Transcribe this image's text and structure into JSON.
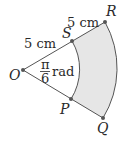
{
  "diagram": {
    "type": "annular sector",
    "colors": {
      "line": "#555555",
      "fill": "#e6e6e6",
      "point": "#555555",
      "text": "#2a2a2a"
    },
    "points": {
      "O": "O",
      "S": "S",
      "R": "R",
      "P": "P",
      "Q": "Q"
    },
    "labels": {
      "os_length": "5 cm",
      "sr_length": "5 cm",
      "angle_num": "π",
      "angle_den": "6",
      "angle_unit": "rad"
    }
  }
}
